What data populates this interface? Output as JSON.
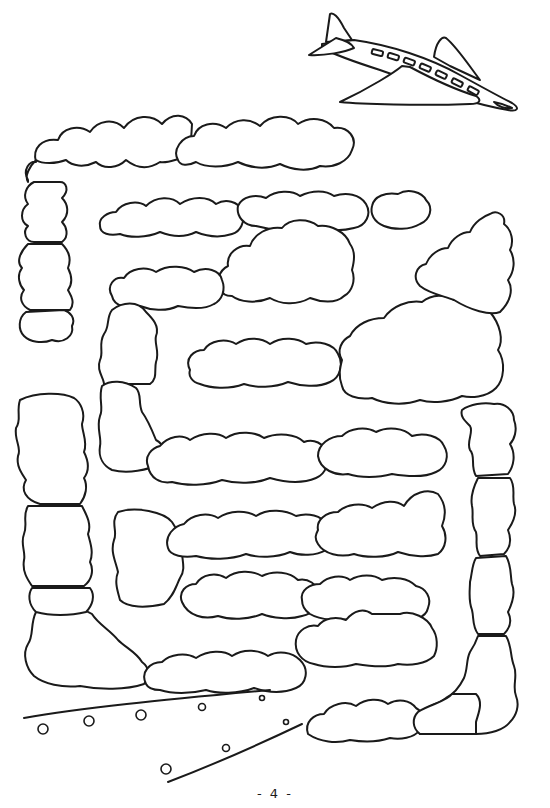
{
  "page": {
    "page_number": "- 4 -",
    "background": "#ffffff",
    "ink_color": "#1a1a1a"
  },
  "maze": {
    "theme": "cloud maze",
    "start": "airplane (top right)",
    "goal": "runway (bottom left)",
    "airplane": {
      "icon": "airplane-icon",
      "windows": 7
    },
    "runway": {
      "icon": "runway-icon",
      "lights": 9
    }
  }
}
